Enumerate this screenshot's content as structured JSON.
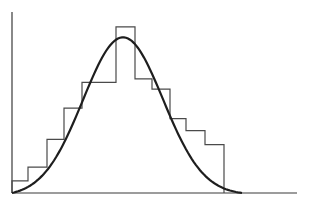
{
  "chart_data": {
    "type": "bar",
    "subtype": "histogram-with-normal-curve-overlay",
    "title": "",
    "xlabel": "",
    "ylabel": "",
    "grid": false,
    "legend": null,
    "bins": 12,
    "categories": [
      "b1",
      "b2",
      "b3",
      "b4",
      "b5",
      "b6",
      "b7",
      "b8",
      "b9",
      "b10",
      "b11",
      "b12"
    ],
    "bin_edges_px": [
      12,
      28,
      47,
      64,
      82,
      116,
      135,
      152,
      170,
      186,
      205,
      224
    ],
    "values": [
      7,
      15,
      31,
      49,
      64,
      96,
      66,
      60,
      43,
      36,
      28,
      0
    ],
    "ylim": [
      0,
      100
    ],
    "series": [
      {
        "name": "histogram",
        "kind": "step",
        "values": [
          7,
          15,
          31,
          49,
          64,
          96,
          66,
          60,
          43,
          36,
          28,
          0
        ]
      },
      {
        "name": "normal-curve",
        "kind": "line",
        "peak_x_px": 123,
        "peak_value": 90,
        "extent_px": [
          12,
          242
        ]
      }
    ],
    "axes": {
      "x_axis_y_px": 193,
      "y_axis_x_px": 12,
      "x_end_px": 297,
      "y_top_px": 12
    }
  }
}
